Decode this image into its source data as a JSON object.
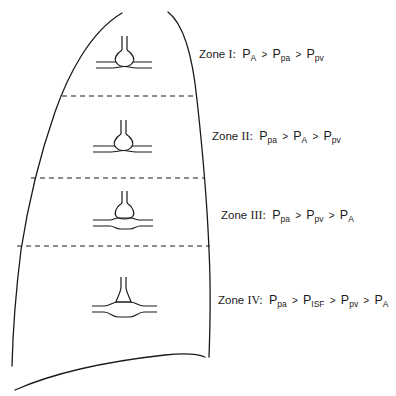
{
  "diagram": {
    "stroke_color": "#1a1a1a",
    "zones": [
      {
        "id": "I",
        "label_prefix": "Zone",
        "numeral": "I:",
        "terms": [
          {
            "p": "P",
            "sub": "A"
          },
          {
            "p": "P",
            "sub": "pa"
          },
          {
            "p": "P",
            "sub": "pv"
          }
        ],
        "operator": ">"
      },
      {
        "id": "II",
        "label_prefix": "Zone",
        "numeral": "II:",
        "terms": [
          {
            "p": "P",
            "sub": "pa"
          },
          {
            "p": "P",
            "sub": "A"
          },
          {
            "p": "P",
            "sub": "pv"
          }
        ],
        "operator": ">"
      },
      {
        "id": "III",
        "label_prefix": "Zone",
        "numeral": "III:",
        "terms": [
          {
            "p": "P",
            "sub": "pa"
          },
          {
            "p": "P",
            "sub": "pv"
          },
          {
            "p": "P",
            "sub": "A"
          }
        ],
        "operator": ">"
      },
      {
        "id": "IV",
        "label_prefix": "Zone",
        "numeral": "IV:",
        "terms": [
          {
            "p": "P",
            "sub": "pa"
          },
          {
            "p": "P",
            "sub": "ISF"
          },
          {
            "p": "P",
            "sub": "pv"
          },
          {
            "p": "P",
            "sub": "A"
          }
        ],
        "operator": ">"
      }
    ]
  }
}
